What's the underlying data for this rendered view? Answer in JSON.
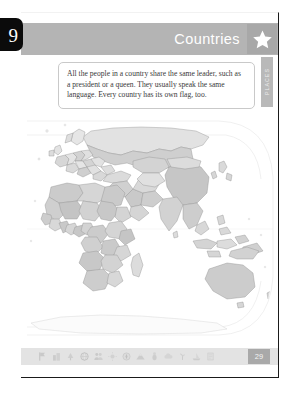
{
  "chapter": {
    "number": "9"
  },
  "header": {
    "title": "Countries",
    "star_icon": "star-icon"
  },
  "section_tab": {
    "label": "PLACES"
  },
  "intro": {
    "text": "All the people in a country share the same leader, such as a president or a queen. They usually speak the same language. Every country has its own flag, too."
  },
  "map": {
    "alt": "world-map",
    "projection": "robinson",
    "land_color": "#d9d9d9",
    "country_color_light": "#eaeaea",
    "border_color": "#8c8c8c",
    "ocean_color": "#ffffff"
  },
  "toolbar": {
    "icons": [
      {
        "name": "flag-icon",
        "label": "Flags"
      },
      {
        "name": "building-icon",
        "label": "Landmarks"
      },
      {
        "name": "tree-icon",
        "label": "Nature"
      },
      {
        "name": "globe-icon",
        "label": "Globe"
      },
      {
        "name": "people-icon",
        "label": "People"
      },
      {
        "name": "sun-icon",
        "label": "Weather"
      },
      {
        "name": "compass-icon",
        "label": "Compass"
      },
      {
        "name": "mountain-icon",
        "label": "Mountains"
      },
      {
        "name": "animal-icon",
        "label": "Animals"
      },
      {
        "name": "cloud-icon",
        "label": "Sky"
      },
      {
        "name": "plant-icon",
        "label": "Plants"
      },
      {
        "name": "boat-icon",
        "label": "Boats"
      },
      {
        "name": "scroll-icon",
        "label": "History"
      }
    ],
    "page_number": "29"
  },
  "colors": {
    "header_band": "#b4b4b4",
    "star_box": "#a8a8a8",
    "tab_black": "#0b0b0b",
    "toolbar": "#e3e3e3",
    "page_badge": "#a9a9a9"
  }
}
